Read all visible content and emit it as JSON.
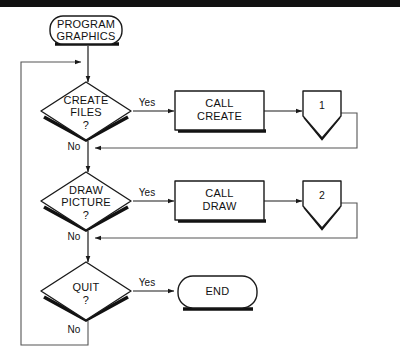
{
  "diagram": {
    "colors": {
      "ink": "#1a1a1a",
      "shadow": "#111111",
      "paper": "#ffffff",
      "loop": "#555555",
      "rule": "#111111"
    },
    "nodes": {
      "start": {
        "type": "terminal",
        "line1": "PROGRAM",
        "line2": "GRAPHICS"
      },
      "decision_create": {
        "type": "decision",
        "line1": "CREATE",
        "line2": "FILES",
        "line3": "?"
      },
      "process_create": {
        "type": "process",
        "line1": "CALL",
        "line2": "CREATE"
      },
      "connector_one": {
        "type": "connector",
        "label": "1"
      },
      "decision_draw": {
        "type": "decision",
        "line1": "DRAW",
        "line2": "PICTURE",
        "line3": "?"
      },
      "process_draw": {
        "type": "process",
        "line1": "CALL",
        "line2": "DRAW"
      },
      "connector_two": {
        "type": "connector",
        "label": "2"
      },
      "decision_quit": {
        "type": "decision",
        "line1": "QUIT",
        "line2": "?"
      },
      "end": {
        "type": "terminal",
        "line1": "END"
      }
    },
    "branches": {
      "create_yes": "Yes",
      "create_no": "No",
      "draw_yes": "Yes",
      "draw_no": "No",
      "quit_yes": "Yes",
      "quit_no": "No"
    }
  }
}
